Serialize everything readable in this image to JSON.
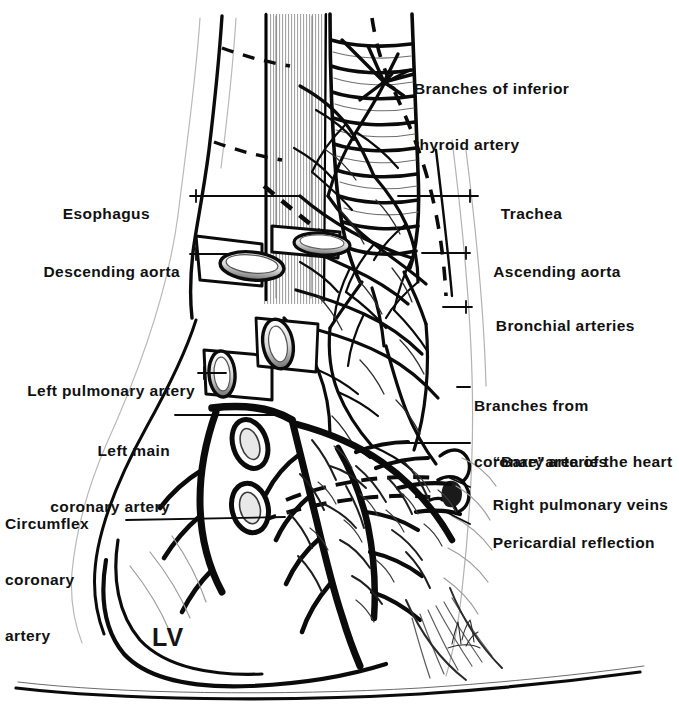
{
  "figure": {
    "type": "anatomical-illustration",
    "background_color": "#ffffff",
    "ink_color": "#000000",
    "chamber_label": "LV",
    "signature_present": true
  },
  "labels_left": [
    {
      "id": "esophagus",
      "text": "Esophagus",
      "lines": [
        "Esophagus"
      ],
      "x": 113,
      "y": 186,
      "leader": {
        "x1": 190,
        "y1": 196,
        "x2": 300,
        "y2": 196
      }
    },
    {
      "id": "descending-aorta",
      "text": "Descending aorta",
      "lines": [
        "Descending aorta"
      ],
      "x": 57,
      "y": 244,
      "leader": {
        "x1": 190,
        "y1": 254,
        "x2": 232,
        "y2": 254
      }
    },
    {
      "id": "left-pulmonary-artery",
      "text": "Left pulmonary artery",
      "lines": [
        "Left pulmonary artery"
      ],
      "x": 22,
      "y": 363,
      "leader": {
        "x1": 198,
        "y1": 373,
        "x2": 226,
        "y2": 373
      }
    },
    {
      "id": "left-main-coronary-artery",
      "text": "Left main coronary artery",
      "lines": [
        "Left main",
        "coronary artery"
      ],
      "x": 72,
      "y": 405,
      "leader": {
        "x1": 175,
        "y1": 415,
        "x2": 283,
        "y2": 415
      }
    },
    {
      "id": "circumflex-coronary-artery",
      "text": "Circumflex coronary artery",
      "lines": [
        "Circumflex",
        "coronary",
        "artery"
      ],
      "x": 31,
      "y": 478,
      "leader": {
        "x1": 126,
        "y1": 520,
        "x2": 285,
        "y2": 517
      }
    }
  ],
  "labels_right": [
    {
      "id": "branches-inferior-thyroid-artery",
      "text": "Branches of inferior thyroid artery",
      "lines": [
        "Branches of inferior",
        "thyroid artery"
      ],
      "x": 414,
      "y": 43,
      "leader": {
        "x1": 410,
        "y1": 70,
        "x2": 381,
        "y2": 84
      }
    },
    {
      "id": "trachea",
      "text": "Trachea",
      "lines": [
        "Trachea"
      ],
      "x": 482,
      "y": 186,
      "leader": {
        "x1": 478,
        "y1": 196,
        "x2": 398,
        "y2": 196
      }
    },
    {
      "id": "ascending-aorta",
      "text": "Ascending aorta",
      "lines": [
        "Ascending aorta"
      ],
      "x": 475,
      "y": 244,
      "leader": {
        "x1": 470,
        "y1": 253,
        "x2": 422,
        "y2": 253
      }
    },
    {
      "id": "bronchial-arteries",
      "text": "Bronchial arteries",
      "lines": [
        "Bronchial arteries"
      ],
      "x": 477,
      "y": 298,
      "leader": {
        "x1": 472,
        "y1": 307,
        "x2": 443,
        "y2": 307
      }
    },
    {
      "id": "branches-from-coronary-arteries",
      "text": "Branches from coronary arteries",
      "lines": [
        "Branches from",
        "coronary arteries"
      ],
      "x": 474,
      "y": 360,
      "leader": {
        "x1": 470,
        "y1": 387,
        "x2": 455,
        "y2": 387
      }
    },
    {
      "id": "bare-area-of-the-heart",
      "text": "“Bare” area of the heart",
      "lines": [
        "“Bare”area of the heart"
      ],
      "x": 474,
      "y": 434,
      "leader": {
        "x1": 470,
        "y1": 443,
        "x2": 400,
        "y2": 443
      }
    },
    {
      "id": "right-pulmonary-veins",
      "text": "Right pulmonary veins",
      "lines": [
        "Right pulmonary veins"
      ],
      "x": 474,
      "y": 477,
      "leader": {
        "x1": 470,
        "y1": 487,
        "x2": 452,
        "y2": 480
      }
    },
    {
      "id": "pericardial-reflection",
      "text": "Pericardial reflection",
      "lines": [
        "Pericardial reflection"
      ],
      "x": 474,
      "y": 515,
      "leader": {
        "x1": 470,
        "y1": 524,
        "x2": 444,
        "y2": 512
      }
    }
  ],
  "structures": [
    {
      "id": "trachea",
      "name": "Trachea with cartilage rings",
      "ring_count": 9
    },
    {
      "id": "esophagus",
      "name": "Esophagus (shaded longitudinal band)"
    },
    {
      "id": "descending-aorta",
      "name": "Descending aorta cut stump"
    },
    {
      "id": "ascending-aorta",
      "name": "Ascending aorta cut stump"
    },
    {
      "id": "left-pulmonary-artery",
      "name": "Left pulmonary artery cut stump"
    },
    {
      "id": "right-pulmonary-veins",
      "name": "Right pulmonary vein stumps"
    },
    {
      "id": "bronchial-arterial-plexus",
      "name": "Bronchial arterial plexus network"
    },
    {
      "id": "left-anterior-descending",
      "name": "Left anterior descending coronary artery"
    },
    {
      "id": "circumflex",
      "name": "Circumflex coronary artery"
    },
    {
      "id": "pericardial-reflection",
      "name": "Pericardial reflection (dashed outline)"
    },
    {
      "id": "diaphragm",
      "name": "Diaphragm line"
    },
    {
      "id": "left-ventricle",
      "name": "Left ventricle (LV)"
    }
  ],
  "lv": {
    "label": "LV",
    "x": 152,
    "y": 623
  }
}
